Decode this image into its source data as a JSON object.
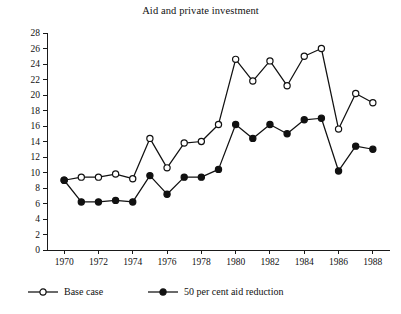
{
  "chart_data": {
    "type": "line",
    "title": "Aid and private investment",
    "xlabel": "",
    "ylabel": "",
    "x": [
      1970,
      1971,
      1972,
      1973,
      1974,
      1975,
      1976,
      1977,
      1978,
      1979,
      1980,
      1981,
      1982,
      1983,
      1984,
      1985,
      1986,
      1987,
      1988
    ],
    "xlim": [
      1969,
      1989
    ],
    "ylim": [
      0,
      28
    ],
    "xticks": [
      1970,
      1972,
      1974,
      1976,
      1978,
      1980,
      1982,
      1984,
      1986,
      1988
    ],
    "xtick_labels": [
      "1970",
      "1972",
      "1974",
      "1976",
      "1978",
      "1980",
      "1982",
      "1984",
      "1986",
      "1988"
    ],
    "yticks": [
      0,
      2,
      4,
      6,
      8,
      10,
      12,
      14,
      16,
      18,
      20,
      22,
      24,
      26,
      28
    ],
    "ytick_labels": [
      "0",
      "2",
      "4",
      "6",
      "8",
      "10",
      "12",
      "14",
      "16",
      "18",
      "20",
      "22",
      "24",
      "26",
      "28"
    ],
    "grid": false,
    "legend_position": "bottom-left",
    "series": [
      {
        "name": "Base case",
        "marker": "open-circle",
        "color": "#111111",
        "values": [
          9.0,
          9.4,
          9.4,
          9.8,
          9.2,
          14.4,
          10.6,
          13.8,
          14.0,
          16.2,
          24.6,
          21.8,
          24.4,
          21.2,
          25.0,
          26.0,
          15.6,
          20.2,
          19.0
        ]
      },
      {
        "name": "50 per cent aid reduction",
        "marker": "filled-circle",
        "color": "#111111",
        "values": [
          9.0,
          6.2,
          6.2,
          6.4,
          6.2,
          9.6,
          7.2,
          9.4,
          9.4,
          10.4,
          16.2,
          14.4,
          16.2,
          15.0,
          16.8,
          17.0,
          10.2,
          13.4,
          13.0
        ]
      }
    ]
  },
  "legend": {
    "items": [
      {
        "label": "Base case",
        "marker": "open-circle"
      },
      {
        "label": "50 per cent aid reduction",
        "marker": "filled-circle"
      }
    ]
  }
}
